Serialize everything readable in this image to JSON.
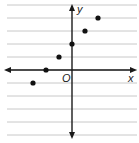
{
  "chart_data": {
    "type": "scatter",
    "title": "",
    "xlabel": "x",
    "ylabel": "y",
    "origin_label": "O",
    "xlim": [
      -5,
      5
    ],
    "ylim": [
      -5,
      5
    ],
    "grid": true,
    "tick_labels": false,
    "points": [
      {
        "x": -3,
        "y": -1
      },
      {
        "x": -2,
        "y": 0
      },
      {
        "x": -1,
        "y": 1
      },
      {
        "x": 0,
        "y": 2
      },
      {
        "x": 1,
        "y": 3
      },
      {
        "x": 2,
        "y": 4
      }
    ]
  },
  "colors": {
    "grid": "#c8c8c8",
    "axis": "#1a1a1a",
    "point": "#111111",
    "background": "#ffffff"
  }
}
